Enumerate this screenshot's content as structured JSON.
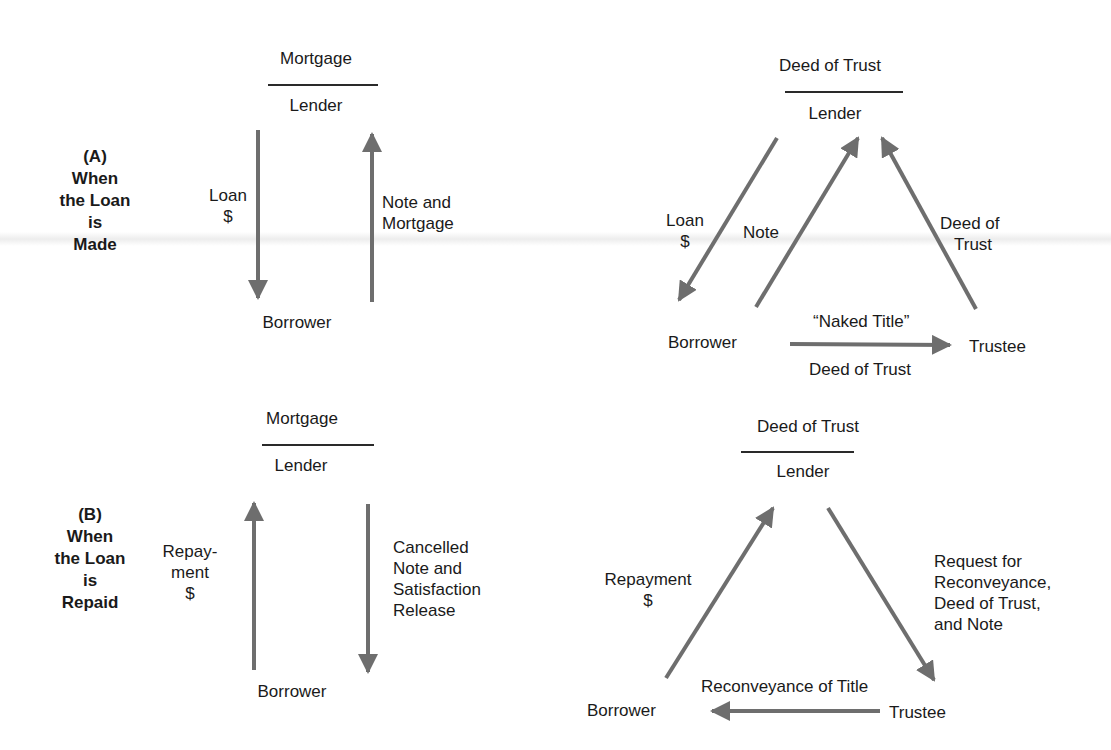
{
  "figure": {
    "arrow_color": "#6e6e6e",
    "text_color": "#1a1a1a"
  },
  "section_a": {
    "letter": "(A)",
    "title_lines": [
      "When",
      "the Loan",
      "is",
      "Made"
    ],
    "mortgage": {
      "instrument": "Mortgage",
      "lender": "Lender",
      "borrower": "Borrower",
      "flows": [
        {
          "label_lines": [
            "Loan",
            "$"
          ],
          "from": "Lender",
          "to": "Borrower"
        },
        {
          "label_lines": [
            "Note and",
            "Mortgage"
          ],
          "from": "Borrower",
          "to": "Lender"
        }
      ]
    },
    "deed_of_trust": {
      "instrument": "Deed of Trust",
      "lender": "Lender",
      "borrower": "Borrower",
      "trustee": "Trustee",
      "flows": [
        {
          "label_lines": [
            "Loan",
            "$"
          ],
          "from": "Lender",
          "to": "Borrower"
        },
        {
          "label_lines": [
            "Note"
          ],
          "from": "Borrower",
          "to": "Lender"
        },
        {
          "label_lines": [
            "Deed of",
            "Trust"
          ],
          "from": "Trustee",
          "to": "Lender"
        },
        {
          "label_top": "“Naked Title”",
          "label_bottom": "Deed of Trust",
          "from": "Borrower",
          "to": "Trustee"
        }
      ]
    }
  },
  "section_b": {
    "letter": "(B)",
    "title_lines": [
      "When",
      "the Loan",
      "is",
      "Repaid"
    ],
    "mortgage": {
      "instrument": "Mortgage",
      "lender": "Lender",
      "borrower": "Borrower",
      "flows": [
        {
          "label_lines": [
            "Repay-",
            "ment",
            "$"
          ],
          "from": "Borrower",
          "to": "Lender"
        },
        {
          "label_lines": [
            "Cancelled",
            "Note and",
            "Satisfaction",
            "Release"
          ],
          "from": "Lender",
          "to": "Borrower"
        }
      ]
    },
    "deed_of_trust": {
      "instrument": "Deed of Trust",
      "lender": "Lender",
      "borrower": "Borrower",
      "trustee": "Trustee",
      "flows": [
        {
          "label_lines": [
            "Repayment",
            "$"
          ],
          "from": "Borrower",
          "to": "Lender"
        },
        {
          "label_lines": [
            "Request for",
            "Reconveyance,",
            "Deed of Trust,",
            "and Note"
          ],
          "from": "Lender",
          "to": "Trustee"
        },
        {
          "label_lines": [
            "Reconveyance of Title"
          ],
          "from": "Trustee",
          "to": "Borrower"
        }
      ]
    }
  }
}
